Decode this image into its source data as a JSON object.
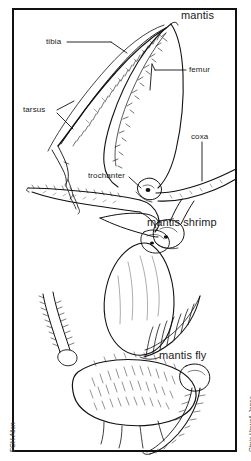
{
  "plate": {
    "title_region": "mantis",
    "background_color": "#ffffff",
    "ink_color": "#111111",
    "frame_color": "#111111"
  },
  "labels": {
    "parts": [
      {
        "id": "tibia",
        "text": "tibia"
      },
      {
        "id": "femur",
        "text": "femur"
      },
      {
        "id": "tarsus",
        "text": "tarsus"
      },
      {
        "id": "coxa",
        "text": "coxa"
      },
      {
        "id": "trochanter",
        "text": "trochanter"
      }
    ],
    "taxa": [
      {
        "id": "mantis",
        "text": "mantis"
      },
      {
        "id": "mantis-shrimp",
        "text": "mantis shrimp"
      },
      {
        "id": "mantis-fly",
        "text": "mantis fly"
      }
    ]
  },
  "credits": {
    "left": "FGH Allen",
    "right": "Chris Howell-Jones"
  }
}
